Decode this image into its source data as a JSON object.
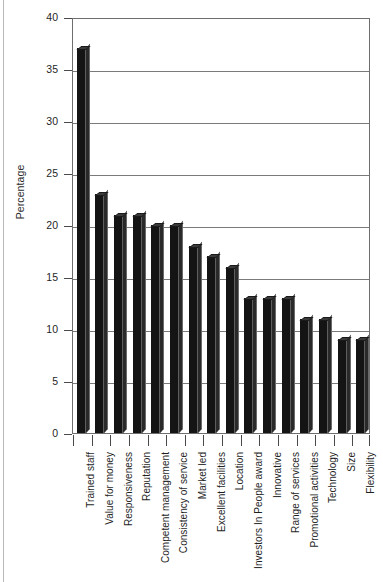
{
  "chart_data": {
    "type": "bar",
    "title": "",
    "xlabel": "",
    "ylabel": "Percentage",
    "ylim": [
      0,
      40
    ],
    "yticks": [
      0,
      5,
      10,
      15,
      20,
      25,
      30,
      35,
      40
    ],
    "grid": true,
    "legend": false,
    "orientation": "vertical",
    "bar_color": "#141414",
    "categories": [
      "Trained staff",
      "Value for money",
      "Responsiveness",
      "Reputation",
      "Competent management",
      "Consistency of service",
      "Market led",
      "Excellent facilities",
      "Location",
      "Investors In People award",
      "Innovative",
      "Range of services",
      "Promotional activities",
      "Technology",
      "Size",
      "Flexibility"
    ],
    "values": [
      37,
      23,
      21,
      21,
      20,
      20,
      18,
      17,
      16,
      13,
      13,
      13,
      11,
      11,
      9,
      9
    ]
  }
}
